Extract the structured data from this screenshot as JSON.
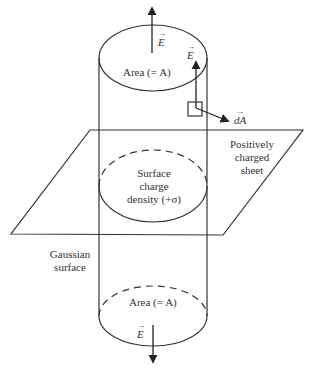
{
  "figure": {
    "type": "gaussian-surface-charged-sheet",
    "colors": {
      "stroke": "#333333",
      "background": "#ffffff"
    }
  },
  "labels": {
    "top_area": "Area (= A)",
    "bottom_area": "Area (= A)",
    "surface_charge_line1": "Surface",
    "surface_charge_line2": "charge",
    "surface_charge_line3": "density (+σ)",
    "sheet_line1": "Positively",
    "sheet_line2": "charged",
    "sheet_line3": "sheet",
    "gaussian_line1": "Gaussian",
    "gaussian_line2": "surface",
    "vector_E": "E",
    "vector_dA": "dA",
    "vector_arrow": "→"
  }
}
